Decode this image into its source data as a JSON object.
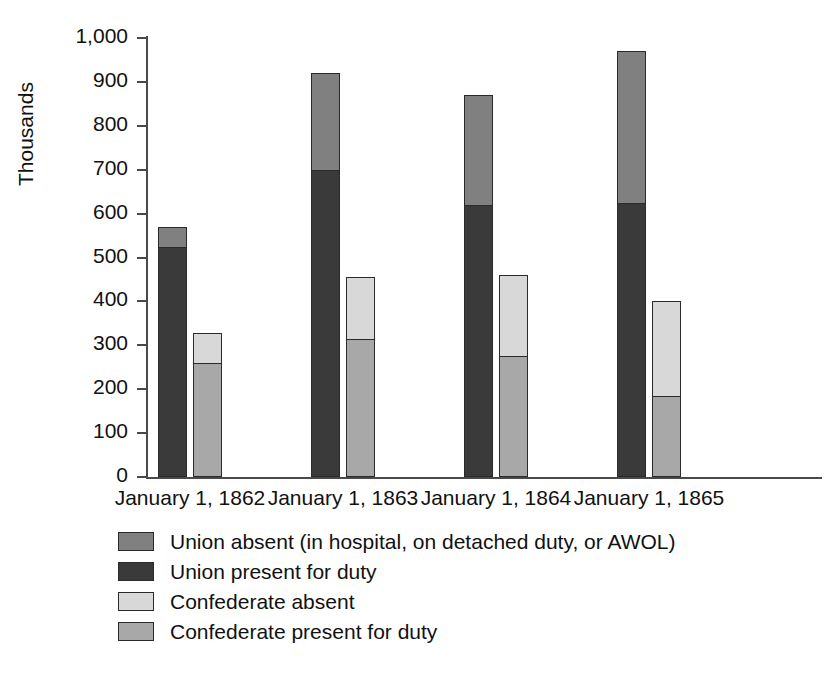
{
  "chart_data": {
    "type": "bar",
    "subtype": "grouped-stacked",
    "title": "",
    "xlabel": "",
    "ylabel": "Thousands",
    "ylim": [
      0,
      1000
    ],
    "ytick_step": 100,
    "grid": false,
    "legend_position": "bottom-left",
    "categories": [
      "January 1, 1862",
      "January 1, 1863",
      "January 1, 1864",
      "January 1, 1865"
    ],
    "ytick_labels": [
      "1,000",
      "900",
      "800",
      "700",
      "600",
      "500",
      "400",
      "300",
      "200",
      "100",
      "0"
    ],
    "ytick_values": [
      1000,
      900,
      800,
      700,
      600,
      500,
      400,
      300,
      200,
      100,
      0
    ],
    "series": [
      {
        "name": "Union present for duty",
        "key": "union_present",
        "stack": "union",
        "color": "#3a3a3a",
        "values": [
          525,
          700,
          620,
          625
        ]
      },
      {
        "name": "Union absent (in hospital, on detached duty, or AWOL)",
        "key": "union_absent",
        "stack": "union",
        "color": "#808080",
        "values": [
          45,
          220,
          250,
          345
        ]
      },
      {
        "name": "Confederate present for duty",
        "key": "confederate_present",
        "stack": "confederate",
        "color": "#a8a8a8",
        "values": [
          262,
          315,
          275,
          185
        ]
      },
      {
        "name": "Confederate absent",
        "key": "confederate_absent",
        "stack": "confederate",
        "color": "#d8d8d8",
        "values": [
          65,
          140,
          185,
          215
        ]
      }
    ],
    "stack_totals": {
      "union": [
        570,
        920,
        870,
        970
      ],
      "confederate": [
        327,
        455,
        460,
        400
      ]
    },
    "annotations": []
  },
  "axis": {
    "y_label": "Thousands"
  },
  "legend": {
    "items": [
      {
        "label": "Union absent (in hospital, on detached duty, or AWOL)",
        "color": "#808080"
      },
      {
        "label": "Union present for duty",
        "color": "#3a3a3a"
      },
      {
        "label": "Confederate absent",
        "color": "#d8d8d8"
      },
      {
        "label": "Confederate present for duty",
        "color": "#a8a8a8"
      }
    ]
  },
  "colors": {
    "union_absent": "#808080",
    "union_present": "#3a3a3a",
    "confederate_absent": "#d8d8d8",
    "confederate_present": "#a8a8a8",
    "axis": "#4a4a4a",
    "text": "#111111",
    "background": "#ffffff"
  }
}
